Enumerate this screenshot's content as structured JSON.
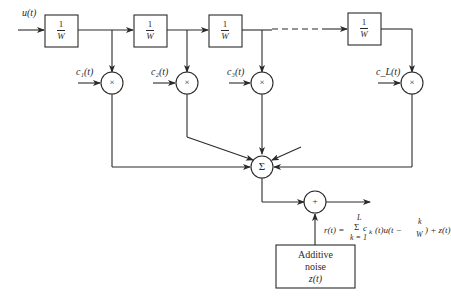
{
  "diagram": {
    "input_label": "u(t)",
    "delay_blocks": [
      {
        "num": "1",
        "den": "W"
      },
      {
        "num": "1",
        "den": "W"
      },
      {
        "num": "1",
        "den": "W"
      },
      {
        "num": "1",
        "den": "W"
      }
    ],
    "tap_gains": [
      "c₁(t)",
      "c₂(t)",
      "c₃(t)",
      "c_L(t)"
    ],
    "multiplier_symbol": "×",
    "summer_symbol": "Σ",
    "adder_symbol": "+",
    "noise_block": {
      "line1": "Additive",
      "line2": "noise",
      "line3": "z(t)"
    },
    "output_formula": {
      "lhs": "r(t) =",
      "sum_upper": "L",
      "sum_symbol": "Σ",
      "sum_lower": "k = 1",
      "term": "c",
      "term_sub": "k",
      "term_rest": "(t)u(t −",
      "frac_num": "k",
      "frac_den": "W",
      "tail": ") + z(t)"
    },
    "colors": {
      "line": "#2a2a2a",
      "background": "#ffffff"
    }
  }
}
